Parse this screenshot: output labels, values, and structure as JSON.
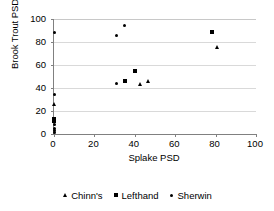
{
  "chart_data": {
    "type": "scatter",
    "title": "",
    "xlabel": "Splake PSD",
    "ylabel": "Brook Trout PSD",
    "xlim": [
      0,
      100
    ],
    "ylim": [
      0,
      100
    ],
    "xticks": [
      0,
      20,
      40,
      60,
      80,
      100
    ],
    "yticks": [
      0,
      20,
      40,
      60,
      80,
      100
    ],
    "grid": "horizontal",
    "legend_position": "bottom",
    "series": [
      {
        "name": "Chinn's",
        "marker": "triangle",
        "color": "#000000",
        "points": [
          {
            "x": 0,
            "y": 25
          },
          {
            "x": 43,
            "y": 43
          },
          {
            "x": 47,
            "y": 45
          },
          {
            "x": 81,
            "y": 75
          }
        ]
      },
      {
        "name": "Lefthand",
        "marker": "square",
        "color": "#000000",
        "points": [
          {
            "x": 0,
            "y": 13
          },
          {
            "x": 0,
            "y": 11
          },
          {
            "x": 35,
            "y": 46
          },
          {
            "x": 40,
            "y": 55
          },
          {
            "x": 78,
            "y": 89
          }
        ]
      },
      {
        "name": "Sherwin",
        "marker": "dot",
        "color": "#000000",
        "points": [
          {
            "x": 0,
            "y": 88
          },
          {
            "x": 0,
            "y": 34
          },
          {
            "x": 0,
            "y": 8
          },
          {
            "x": 0,
            "y": 5
          },
          {
            "x": 0,
            "y": 3
          },
          {
            "x": 0,
            "y": 1
          },
          {
            "x": 31,
            "y": 86
          },
          {
            "x": 35,
            "y": 94
          },
          {
            "x": 31,
            "y": 44
          }
        ]
      }
    ]
  },
  "axes": {
    "x_title": "Splake PSD",
    "y_title": "Brook Trout PSD",
    "x_tick_labels": [
      "0",
      "20",
      "40",
      "60",
      "80",
      "100"
    ],
    "y_tick_labels": [
      "0",
      "20",
      "40",
      "60",
      "80",
      "100"
    ]
  },
  "legend": {
    "entries": [
      {
        "label": "Chinn's",
        "marker": "triangle"
      },
      {
        "label": "Lefthand",
        "marker": "square"
      },
      {
        "label": "Sherwin",
        "marker": "dot"
      }
    ]
  }
}
